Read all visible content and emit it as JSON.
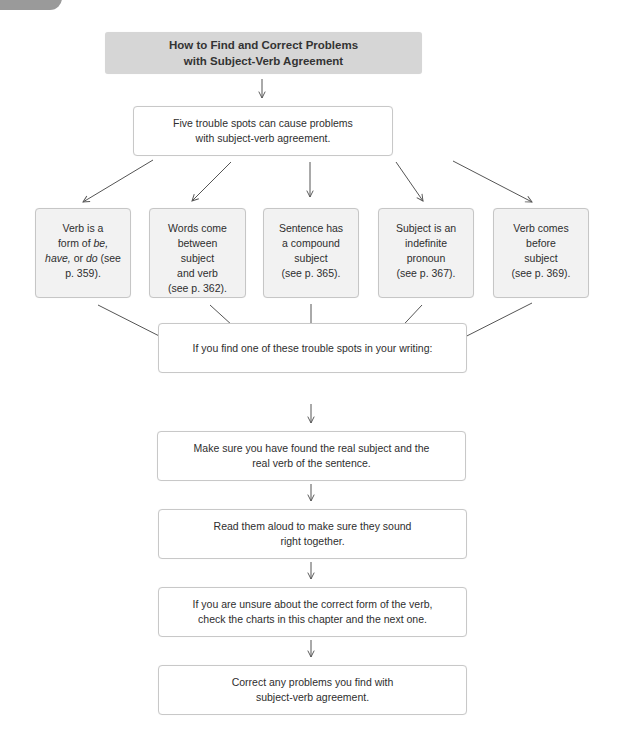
{
  "title": {
    "line1": "How to Find and Correct Problems",
    "line2": "with Subject-Verb Agreement"
  },
  "intro_box": {
    "text": "Five trouble spots can cause problems\nwith subject-verb agreement."
  },
  "trouble_spots": [
    {
      "parts": [
        {
          "text": "Verb is a\nform of ",
          "italic": false
        },
        {
          "text": "be,",
          "italic": true
        },
        {
          "text": "\n",
          "italic": false
        },
        {
          "text": "have,",
          "italic": true
        },
        {
          "text": " or ",
          "italic": false
        },
        {
          "text": "do",
          "italic": true
        },
        {
          "text": " (see\np. 359).",
          "italic": false
        }
      ]
    },
    {
      "text": "Words come\nbetween\nsubject\nand verb\n(see p. 362)."
    },
    {
      "text": "Sentence has\na compound\nsubject\n(see p. 365)."
    },
    {
      "text": "Subject is an\nindefinite\npronoun\n(see p. 367)."
    },
    {
      "text": "Verb comes\nbefore\nsubject\n(see p. 369)."
    }
  ],
  "steps": [
    {
      "text": "If you find one of these trouble spots in your writing:"
    },
    {
      "text": "Make sure you have found the real subject and the\nreal verb of the sentence."
    },
    {
      "text": "Read them aloud to make sure they sound\nright together."
    },
    {
      "text": "If you are unsure about the correct form of the verb,\ncheck the charts in this chapter and the next one."
    },
    {
      "text": "Correct any problems you find with\nsubject-verb agreement."
    }
  ],
  "colors": {
    "title_fill": "#d6d6d6",
    "spot_fill": "#f2f2f2",
    "box_border": "#c8c8c8",
    "arrow": "#555555",
    "corner_tab": "#9a9a9a"
  }
}
